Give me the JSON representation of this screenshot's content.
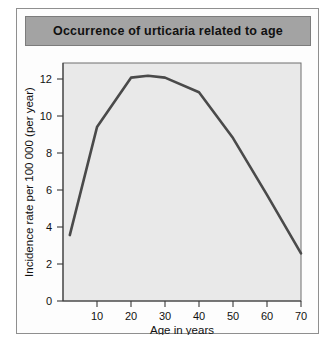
{
  "figure": {
    "title": "Occurrence of urticaria related to age",
    "header_bg": "#a3a3a3",
    "plot_bg": "#e9e9e9",
    "curve_color": "#4a4a4a"
  },
  "chart_data": {
    "type": "line",
    "title": "Occurrence of urticaria related to age",
    "xlabel": "Age in years",
    "ylabel": "Incidence rate per 100 000 (per year)",
    "xlim": [
      0,
      70
    ],
    "ylim": [
      0,
      13
    ],
    "xticks": [
      10,
      20,
      30,
      40,
      50,
      60,
      70
    ],
    "yticks": [
      0,
      2,
      4,
      6,
      8,
      10,
      12
    ],
    "xtick_labels": [
      "10",
      "20",
      "30",
      "40",
      "50",
      "60",
      "70"
    ],
    "ytick_labels": [
      "0",
      "2",
      "4",
      "6",
      "8",
      "10",
      "12"
    ],
    "grid": false,
    "legend": false,
    "series": [
      {
        "name": "Incidence rate",
        "x": [
          2,
          10,
          20,
          25,
          30,
          40,
          50,
          60,
          70
        ],
        "values": [
          3.6,
          9.5,
          12.2,
          12.3,
          12.2,
          11.4,
          8.9,
          5.8,
          2.6
        ]
      }
    ]
  }
}
